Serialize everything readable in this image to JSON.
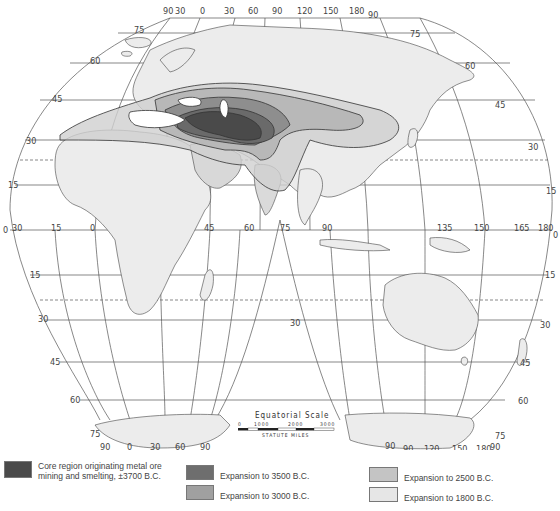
{
  "map": {
    "projection": "interrupted homolosine",
    "colors": {
      "core": "#4a4a4a",
      "exp3500": "#7a7a7a",
      "exp3000": "#a6a6a6",
      "exp2500": "#c7c7c7",
      "exp1800": "#e4e4e4",
      "land": "#ececec",
      "ocean": "#ffffff"
    },
    "top_longitude_labels_left": [
      "90",
      "30",
      "0",
      "30",
      "60"
    ],
    "top_longitude_labels_right": [
      "90",
      "120",
      "150",
      "180",
      "90"
    ],
    "latitude_labels_left_north": [
      "75",
      "60",
      "45",
      "30",
      "15",
      "0"
    ],
    "latitude_labels_right_north": [
      "75",
      "60",
      "45",
      "30",
      "15",
      "0"
    ],
    "equator_longitude_labels": [
      "30",
      "15",
      "0",
      "15",
      "30",
      "45",
      "60",
      "75",
      "90",
      "105",
      "120",
      "135",
      "150",
      "165",
      "180"
    ],
    "latitude_labels_south": [
      "15",
      "30",
      "45",
      "60",
      "75"
    ],
    "bottom_longitude_labels_left": [
      "90",
      "0",
      "30",
      "60",
      "90"
    ],
    "bottom_longitude_labels_right": [
      "90",
      "90",
      "120",
      "150",
      "180",
      "90"
    ],
    "ocean_label_30": "30",
    "scale": {
      "title": "Equatorial   Scale",
      "ticks": [
        "0",
        "1000",
        "2000",
        "3000"
      ],
      "units": "STATUTE   MILES"
    }
  },
  "legend": {
    "items": [
      {
        "label_line1": "Core region originating metal ore",
        "label_line2": "mining and smelting, ±3700 B.C.",
        "color": "#4a4a4a"
      },
      {
        "label": "Expansion to 3500 B.C.",
        "color": "#6e6e6e"
      },
      {
        "label": "Expansion to 3000 B.C.",
        "color": "#a0a0a0"
      },
      {
        "label": "Expansion to 2500 B.C.",
        "color": "#c4c4c4"
      },
      {
        "label": "Expansion to 1800 B.C.",
        "color": "#e6e6e6"
      }
    ]
  }
}
